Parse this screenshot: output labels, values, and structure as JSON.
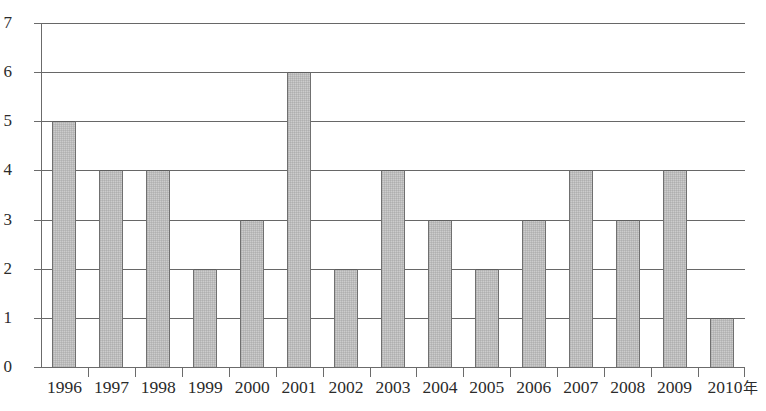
{
  "chart_data": {
    "type": "bar",
    "title": "",
    "subtitle": "",
    "xlabel": "年",
    "ylabel": "",
    "categories": [
      "1996",
      "1997",
      "1998",
      "1999",
      "2000",
      "2001",
      "2002",
      "2003",
      "2004",
      "2005",
      "2006",
      "2007",
      "2008",
      "2009",
      "2010"
    ],
    "values": [
      5,
      4,
      4,
      2,
      3,
      6,
      2,
      4,
      3,
      2,
      3,
      4,
      3,
      4,
      1
    ],
    "y_ticks": [
      "0",
      "1",
      "2",
      "3",
      "4",
      "5",
      "6",
      "7"
    ],
    "ylim": [
      0,
      7
    ],
    "grid": true,
    "legend": "none",
    "bar_fill_color": "#cccccc",
    "bar_border_color": "#707070",
    "gridline_color": "#676767",
    "axis_color": "#6b6b6b",
    "text_color": "#2b2b2b",
    "x_axis_unit_suffix": "年"
  }
}
